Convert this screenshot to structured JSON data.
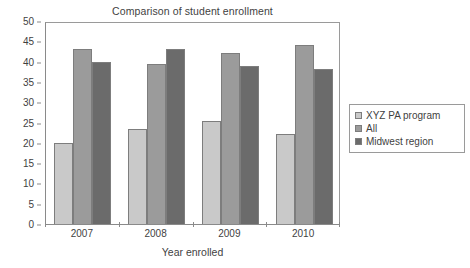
{
  "chart_data": {
    "type": "bar",
    "title": "Comparison of student enrollment",
    "xlabel": "Year enrolled",
    "ylabel": "",
    "categories": [
      "2007",
      "2008",
      "2009",
      "2010"
    ],
    "series": [
      {
        "name": "XYZ PA program",
        "values": [
          20.0,
          23.3,
          25.3,
          22.2
        ],
        "color": "#c9c9c9"
      },
      {
        "name": "All",
        "values": [
          43.0,
          39.5,
          42.0,
          44.0
        ],
        "color": "#9b9b9b"
      },
      {
        "name": "Midwest region",
        "values": [
          40.0,
          43.0,
          39.0,
          38.2
        ],
        "color": "#6b6b6b"
      }
    ],
    "ylim": [
      0,
      50
    ],
    "yticks": [
      0,
      5,
      10,
      15,
      20,
      25,
      30,
      35,
      40,
      45,
      50
    ],
    "ytick_labels": [
      "0",
      "5",
      "10",
      "15",
      "20",
      "25",
      "30",
      "35",
      "40",
      "45",
      "50"
    ],
    "grid": false,
    "legend_position": "right"
  },
  "legend": {
    "entries": [
      {
        "label": "XYZ PA program"
      },
      {
        "label": "All"
      },
      {
        "label": "Midwest region"
      }
    ]
  }
}
